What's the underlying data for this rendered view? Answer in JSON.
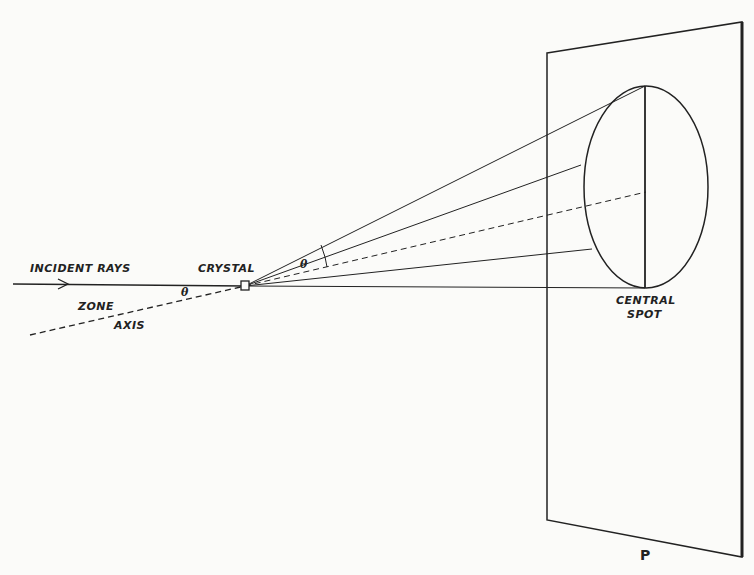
{
  "diagram": {
    "labels": {
      "incident_rays": "INCIDENT RAYS",
      "crystal": "CRYSTAL",
      "zone": "ZONE",
      "axis": "AXIS",
      "theta_left": "θ",
      "theta_cone": "θ",
      "central_spot_line1": "CENTRAL",
      "central_spot_line2": "SPOT",
      "plate": "P"
    },
    "colors": {
      "ink": "#222222",
      "paper": "#fbfbf9"
    }
  }
}
